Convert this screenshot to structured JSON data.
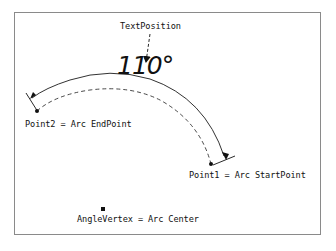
{
  "diagram": {
    "type": "angle-arc-annotation",
    "colors": {
      "ink": "#111111",
      "frame": "#8a8a8a",
      "background": "#ffffff"
    },
    "angle_text": "110°",
    "labels": {
      "text_position": "TextPosition",
      "point2": "Point2 = Arc EndPoint",
      "point1": "Point1 = Arc StartPoint",
      "angle_vertex": "AngleVertex = Arc Center"
    },
    "nodes": [
      {
        "id": "text_position",
        "label": "TextPosition"
      },
      {
        "id": "point1",
        "label": "Point1 = Arc StartPoint"
      },
      {
        "id": "point2",
        "label": "Point2 = Arc EndPoint"
      },
      {
        "id": "angle_vertex",
        "label": "AngleVertex = Arc Center"
      }
    ],
    "edges": [
      {
        "from": "point1",
        "to": "point2",
        "style": "solid-arc-with-arrowheads",
        "meaning": "dimension arc"
      },
      {
        "from": "point1",
        "to": "point2",
        "style": "dashed-arc",
        "meaning": "actual arc through points"
      },
      {
        "from": "text_position",
        "to": "angle_text",
        "style": "dashed-arrow",
        "meaning": "text anchor pointer"
      }
    ]
  }
}
